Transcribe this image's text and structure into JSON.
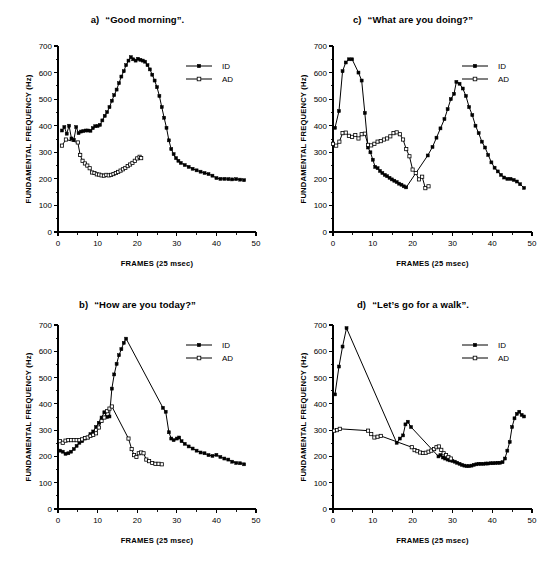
{
  "figure": {
    "axis": {
      "xlabel": "FRAMES (25 msec)",
      "ylabel": "FUNDAMENTAL FREQUENCY (Hz)",
      "xticks": [
        0,
        10,
        20,
        30,
        40,
        50
      ],
      "yticks": [
        0,
        100,
        200,
        300,
        400,
        500,
        600,
        700
      ],
      "xlim": [
        0,
        50
      ],
      "ylim": [
        0,
        700
      ]
    },
    "legend": {
      "entries": [
        {
          "name": "ID",
          "marker": "filled-square"
        },
        {
          "name": "AD",
          "marker": "open-square"
        }
      ]
    },
    "colors": {
      "ink": "#000000",
      "paper": "#ffffff"
    }
  },
  "chart_data": [
    {
      "type": "line",
      "panel": "a",
      "panel_label": "a)",
      "title": "“Good morning”.",
      "xlabel": "FRAMES (25 msec)",
      "ylabel": "FUNDAMENTAL FREQUENCY (Hz)",
      "xlim": [
        0,
        50
      ],
      "ylim": [
        0,
        700
      ],
      "grid": false,
      "legend_position": "top-right",
      "series": [
        {
          "name": "ID",
          "marker": "filled-square",
          "x": [
            1,
            1.6,
            2.2,
            2.8,
            3.4,
            4,
            4.6,
            5.2,
            5.8,
            6.4,
            7,
            7.6,
            8.2,
            8.8,
            9.4,
            10,
            10.6,
            11.2,
            11.8,
            12.4,
            13,
            13.6,
            14.2,
            14.8,
            15.4,
            16,
            16.6,
            17.2,
            17.8,
            18.4,
            19,
            19.6,
            20.2,
            20.8,
            21.4,
            22,
            22.6,
            23.2,
            23.8,
            24.4,
            25,
            25.6,
            26.2,
            26.8,
            27.4,
            28,
            28.6,
            29.2,
            29.8,
            30.4,
            31,
            32,
            33,
            34,
            35,
            36,
            37,
            38,
            39,
            40,
            41,
            42,
            43,
            44,
            45,
            46,
            47
          ],
          "y": [
            382,
            395,
            370,
            400,
            352,
            347,
            395,
            372,
            378,
            380,
            382,
            382,
            381,
            391,
            398,
            399,
            403,
            420,
            437,
            451,
            470,
            494,
            515,
            536,
            560,
            585,
            605,
            628,
            645,
            658,
            650,
            645,
            652,
            648,
            645,
            641,
            628,
            612,
            592,
            570,
            545,
            512,
            470,
            430,
            392,
            345,
            312,
            293,
            278,
            268,
            260,
            252,
            245,
            238,
            232,
            227,
            222,
            218,
            212,
            203,
            200,
            200,
            199,
            198,
            199,
            197,
            195
          ]
        },
        {
          "name": "AD",
          "marker": "open-square",
          "x": [
            1,
            2,
            5,
            5.6,
            6.2,
            6.8,
            7.4,
            8,
            8.6,
            9.2,
            9.8,
            10.4,
            11,
            11.6,
            12.2,
            12.8,
            13.4,
            14,
            14.6,
            15.2,
            15.8,
            16.4,
            17,
            17.6,
            18.2,
            18.8,
            19.4,
            20,
            20.6,
            21
          ],
          "y": [
            325,
            348,
            337,
            290,
            268,
            258,
            250,
            240,
            224,
            222,
            217,
            216,
            213,
            212,
            215,
            213,
            215,
            218,
            222,
            226,
            231,
            236,
            241,
            248,
            254,
            260,
            268,
            277,
            283,
            278
          ]
        }
      ]
    },
    {
      "type": "line",
      "panel": "c",
      "panel_label": "c)",
      "title": "“What are you doing?”",
      "xlabel": "FRAMES (25 msec)",
      "ylabel": "FUNDAMENTAL FREQUENCY (Hz)",
      "xlim": [
        0,
        50
      ],
      "ylim": [
        0,
        700
      ],
      "grid": false,
      "legend_position": "top-right",
      "series": [
        {
          "name": "ID",
          "marker": "filled-square",
          "x": [
            0.5,
            1.5,
            2.4,
            3.2,
            4,
            4.8,
            6.4,
            7.2,
            8,
            8.8,
            9.4,
            10,
            10.6,
            11.2,
            11.8,
            12.4,
            13,
            13.6,
            14.2,
            14.8,
            15.4,
            16,
            16.6,
            17.2,
            17.8,
            18.4,
            23.8,
            25,
            26,
            27,
            28,
            28.8,
            29.6,
            30.4,
            31,
            31.8,
            32.6,
            33.4,
            34.2,
            35,
            35.8,
            36.6,
            37.4,
            38.2,
            39,
            39.8,
            40.6,
            41.4,
            42.2,
            43,
            43.8,
            44.6,
            45.4,
            46.2,
            47,
            48
          ],
          "y": [
            392,
            455,
            605,
            638,
            650,
            650,
            600,
            570,
            448,
            318,
            300,
            272,
            245,
            240,
            230,
            222,
            215,
            210,
            204,
            198,
            193,
            188,
            182,
            178,
            172,
            168,
            288,
            320,
            355,
            390,
            425,
            462,
            500,
            520,
            565,
            558,
            540,
            512,
            470,
            440,
            400,
            372,
            340,
            318,
            290,
            262,
            242,
            228,
            215,
            205,
            200,
            200,
            196,
            190,
            180,
            166
          ]
        },
        {
          "name": "AD",
          "marker": "open-square",
          "x": [
            0,
            0.8,
            1.6,
            2.4,
            3.2,
            4,
            4.8,
            5.6,
            6.4,
            7.2,
            8,
            8.8,
            9.6,
            10.4,
            11.2,
            12,
            12.8,
            13.6,
            14.4,
            15.2,
            16,
            16.8,
            17.6,
            18.4,
            19.2,
            20,
            20.8,
            21.6,
            22.4,
            23.2,
            24
          ],
          "y": [
            332,
            325,
            340,
            372,
            374,
            362,
            358,
            365,
            352,
            368,
            370,
            328,
            326,
            332,
            340,
            342,
            348,
            352,
            360,
            372,
            375,
            368,
            348,
            312,
            285,
            235,
            222,
            198,
            208,
            165,
            172
          ]
        }
      ]
    },
    {
      "type": "line",
      "panel": "b",
      "panel_label": "b)",
      "title": "“How are you today?”",
      "xlabel": "FRAMES (25 msec)",
      "ylabel": "FUNDAMENTAL FREQUENCY (Hz)",
      "xlim": [
        0,
        50
      ],
      "ylim": [
        0,
        700
      ],
      "grid": false,
      "legend_position": "top-right",
      "series": [
        {
          "name": "ID",
          "marker": "filled-square",
          "x": [
            0.5,
            1.2,
            1.9,
            2.6,
            3.3,
            4,
            4.7,
            5.4,
            6.1,
            6.8,
            7.5,
            8.2,
            8.9,
            9.6,
            10.3,
            11,
            11.7,
            12.4,
            13,
            13.6,
            14.2,
            14.8,
            15.4,
            16,
            16.6,
            17.2,
            26.5,
            27.2,
            28,
            28.6,
            29.2,
            30,
            30.6,
            31.2,
            32,
            33,
            34,
            35,
            36,
            37,
            38,
            39,
            40,
            41,
            42,
            43,
            44,
            45,
            46,
            47
          ],
          "y": [
            222,
            218,
            210,
            212,
            218,
            228,
            240,
            252,
            258,
            268,
            272,
            285,
            295,
            312,
            328,
            348,
            368,
            350,
            352,
            458,
            512,
            552,
            585,
            608,
            632,
            648,
            385,
            370,
            292,
            268,
            262,
            268,
            272,
            258,
            248,
            238,
            230,
            222,
            215,
            212,
            205,
            202,
            206,
            198,
            192,
            188,
            180,
            175,
            174,
            170
          ]
        },
        {
          "name": "AD",
          "marker": "open-square",
          "x": [
            0.5,
            1.2,
            1.9,
            2.6,
            3.3,
            4,
            4.7,
            5.4,
            6.1,
            6.8,
            7.5,
            8.2,
            8.9,
            9.6,
            10.3,
            11,
            11.7,
            12.4,
            13,
            13.6,
            17.8,
            18.6,
            19.2,
            19.8,
            20.4,
            21,
            21.6,
            22.3,
            23,
            23.8,
            24.6,
            25.4,
            26.2
          ],
          "y": [
            258,
            252,
            260,
            262,
            262,
            262,
            262,
            262,
            265,
            270,
            272,
            278,
            282,
            288,
            310,
            335,
            348,
            372,
            382,
            390,
            268,
            228,
            205,
            198,
            212,
            215,
            212,
            188,
            182,
            175,
            172,
            172,
            170
          ]
        }
      ]
    },
    {
      "type": "line",
      "panel": "d",
      "panel_label": "d)",
      "title": "“Let’s go for a walk”.",
      "xlabel": "FRAMES (25 msec)",
      "ylabel": "FUNDAMENTAL FREQUENCY (Hz)",
      "xlim": [
        0,
        50
      ],
      "ylim": [
        0,
        700
      ],
      "grid": false,
      "legend_position": "top-right",
      "series": [
        {
          "name": "ID",
          "marker": "filled-square",
          "x": [
            0.5,
            1.5,
            2.4,
            3.4,
            16,
            16.8,
            17.6,
            18.2,
            18.8,
            19.6,
            26.5,
            27,
            27.6,
            28.2,
            28.8,
            29.4,
            30,
            30.6,
            31.2,
            31.8,
            32.4,
            33,
            33.6,
            34.2,
            34.8,
            35.4,
            36,
            36.6,
            37.2,
            37.8,
            38.4,
            39,
            39.6,
            40.2,
            40.8,
            41.4,
            42,
            42.6,
            43.2,
            43.8,
            44.4,
            45,
            45.6,
            46.2,
            46.8,
            47.4,
            48
          ],
          "y": [
            436,
            542,
            618,
            688,
            252,
            268,
            280,
            322,
            332,
            312,
            200,
            205,
            196,
            192,
            188,
            185,
            183,
            180,
            176,
            172,
            168,
            165,
            163,
            163,
            165,
            168,
            170,
            172,
            172,
            172,
            173,
            173,
            174,
            174,
            175,
            176,
            176,
            178,
            192,
            222,
            255,
            312,
            345,
            362,
            370,
            358,
            352
          ]
        },
        {
          "name": "AD",
          "marker": "open-square",
          "x": [
            0.3,
            1,
            1.7,
            8.8,
            9.6,
            10.4,
            11.2,
            12,
            19.8,
            20.5,
            21.2,
            21.9,
            22.6,
            23.3,
            24,
            24.7,
            25.4,
            26,
            26.6,
            27.2,
            27.8,
            28.4,
            29,
            29.6
          ],
          "y": [
            298,
            300,
            305,
            298,
            285,
            272,
            275,
            278,
            235,
            224,
            220,
            215,
            213,
            214,
            218,
            222,
            228,
            235,
            238,
            225,
            212,
            205,
            198,
            192
          ]
        }
      ]
    }
  ]
}
